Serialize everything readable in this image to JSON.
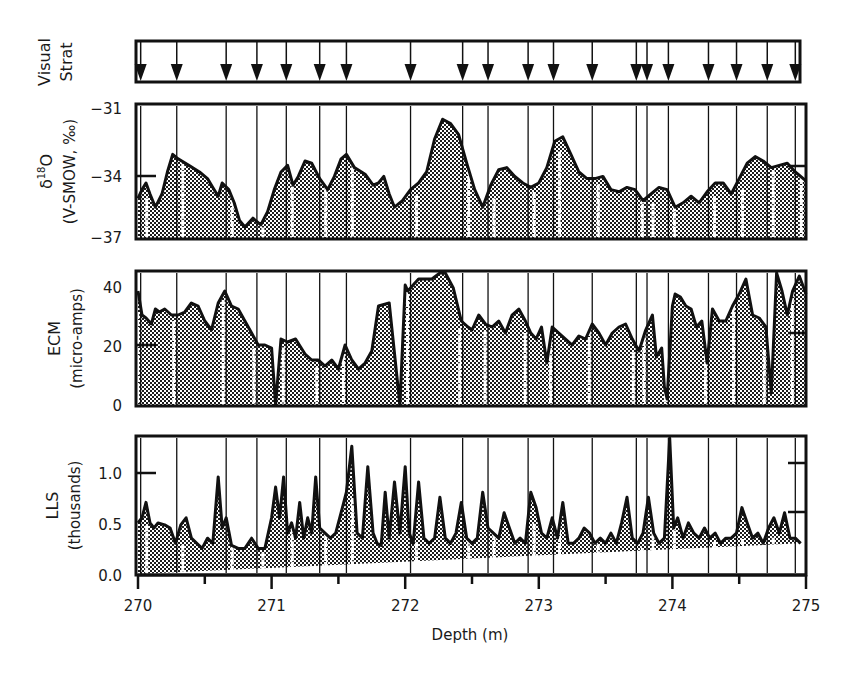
{
  "chart_data": {
    "type": "area",
    "title": "",
    "xlabel": "Depth (m)",
    "xlim": [
      270,
      275
    ],
    "x_ticks_major": [
      270,
      271,
      272,
      273,
      274,
      275
    ],
    "x_tick_labels": [
      "270",
      "271",
      "272",
      "273",
      "274",
      "275"
    ],
    "x_ticks_minor": [
      270.5,
      271.5,
      272.5,
      273.5,
      274.5
    ],
    "grid": false,
    "legend": null,
    "annual_layer_markers": {
      "label_line1": "Visual",
      "label_line2": "Strat",
      "description": "Downward arrows mark annual layers picked by visual stratigraphy; vertical lines extend through all panels.",
      "depths": [
        270.02,
        270.29,
        270.66,
        270.89,
        271.11,
        271.36,
        271.56,
        272.04,
        272.43,
        272.62,
        272.92,
        273.11,
        273.4,
        273.73,
        273.81,
        273.97,
        274.27,
        274.48,
        274.71,
        274.92
      ]
    },
    "panels": [
      {
        "id": "d18o",
        "ylabel_line1": "δ18O",
        "ylabel_sup": "18",
        "ylabel_line2": "(V-SMOW, ‰)",
        "ylim": [
          -37,
          -31
        ],
        "y_ticks": [
          -31,
          -34,
          -37
        ],
        "y_tick_labels": [
          "−31",
          "−34",
          "−37"
        ],
        "left_marker": -34,
        "right_marker": -34,
        "series": {
          "x": [
            270.0,
            270.03,
            270.06,
            270.09,
            270.13,
            270.18,
            270.22,
            270.26,
            270.3,
            270.38,
            270.46,
            270.52,
            270.56,
            270.6,
            270.63,
            270.68,
            270.72,
            270.76,
            270.8,
            270.86,
            270.92,
            270.97,
            271.02,
            271.07,
            271.12,
            271.16,
            271.2,
            271.25,
            271.3,
            271.36,
            271.42,
            271.47,
            271.52,
            271.56,
            271.62,
            271.7,
            271.76,
            271.8,
            271.84,
            271.88,
            271.92,
            271.98,
            272.04,
            272.1,
            272.16,
            272.22,
            272.28,
            272.34,
            272.4,
            272.46,
            272.52,
            272.58,
            272.64,
            272.7,
            272.76,
            272.82,
            272.88,
            272.94,
            273.0,
            273.06,
            273.12,
            273.18,
            273.24,
            273.3,
            273.36,
            273.42,
            273.48,
            273.54,
            273.6,
            273.66,
            273.72,
            273.78,
            273.84,
            273.9,
            273.96,
            274.02,
            274.08,
            274.14,
            274.2,
            274.26,
            274.32,
            274.38,
            274.44,
            274.5,
            274.56,
            274.62,
            274.68,
            274.74,
            274.8,
            274.86,
            274.92,
            275.0
          ],
          "values": [
            -35.2,
            -34.8,
            -34.5,
            -35.0,
            -35.6,
            -35.0,
            -34.0,
            -33.2,
            -33.4,
            -33.7,
            -34.0,
            -34.3,
            -34.7,
            -35.1,
            -34.5,
            -34.8,
            -35.4,
            -36.2,
            -36.5,
            -36.1,
            -36.4,
            -35.8,
            -34.8,
            -34.0,
            -33.7,
            -34.6,
            -34.2,
            -33.5,
            -33.6,
            -34.3,
            -34.8,
            -34.2,
            -33.4,
            -33.2,
            -33.8,
            -34.1,
            -34.6,
            -34.5,
            -34.2,
            -35.0,
            -35.6,
            -35.3,
            -34.8,
            -34.5,
            -34.0,
            -32.5,
            -31.6,
            -31.8,
            -32.3,
            -33.6,
            -34.8,
            -35.6,
            -34.6,
            -33.9,
            -33.8,
            -34.2,
            -34.5,
            -34.7,
            -34.5,
            -33.8,
            -32.6,
            -32.4,
            -33.2,
            -34.0,
            -34.3,
            -34.3,
            -34.2,
            -34.8,
            -34.9,
            -34.7,
            -34.8,
            -35.3,
            -35.0,
            -34.7,
            -34.8,
            -35.6,
            -35.4,
            -35.1,
            -35.4,
            -34.9,
            -34.5,
            -34.5,
            -35.0,
            -34.3,
            -33.6,
            -33.3,
            -33.5,
            -33.8,
            -33.7,
            -33.6,
            -34.0,
            -34.4
          ]
        }
      },
      {
        "id": "ecm",
        "ylabel_line1": "ECM",
        "ylabel_line2": "(micro-amps)",
        "ylim": [
          0,
          44
        ],
        "y_ticks": [
          0,
          20,
          40
        ],
        "y_tick_labels": [
          "0",
          "20",
          "40"
        ],
        "left_marker": 20,
        "right_marker": 23,
        "series": {
          "x": [
            270.0,
            270.03,
            270.06,
            270.1,
            270.13,
            270.16,
            270.2,
            270.25,
            270.3,
            270.35,
            270.4,
            270.45,
            270.5,
            270.55,
            270.6,
            270.65,
            270.7,
            270.75,
            270.8,
            270.85,
            270.9,
            270.95,
            271.0,
            271.03,
            271.07,
            271.12,
            271.18,
            271.25,
            271.3,
            271.35,
            271.4,
            271.45,
            271.5,
            271.55,
            271.6,
            271.65,
            271.7,
            271.75,
            271.8,
            271.88,
            271.96,
            272.0,
            272.02,
            272.06,
            272.1,
            272.14,
            272.2,
            272.26,
            272.3,
            272.36,
            272.42,
            272.47,
            272.5,
            272.55,
            272.6,
            272.65,
            272.7,
            272.75,
            272.8,
            272.85,
            272.9,
            272.94,
            272.98,
            273.02,
            273.06,
            273.1,
            273.15,
            273.2,
            273.25,
            273.3,
            273.35,
            273.4,
            273.45,
            273.5,
            273.55,
            273.6,
            273.65,
            273.7,
            273.75,
            273.8,
            273.85,
            273.88,
            273.92,
            273.94,
            273.96,
            274.0,
            274.02,
            274.06,
            274.1,
            274.14,
            274.18,
            274.22,
            274.26,
            274.3,
            274.35,
            274.4,
            274.45,
            274.5,
            274.55,
            274.6,
            274.65,
            274.7,
            274.74,
            274.78,
            274.82,
            274.86,
            274.9,
            274.95,
            275.0
          ],
          "values": [
            38,
            30,
            29,
            27,
            32,
            31,
            32,
            30,
            30,
            31,
            34,
            33,
            28,
            25,
            34,
            38,
            33,
            32,
            28,
            24,
            20,
            20,
            19,
            0,
            22,
            21,
            22,
            17,
            15,
            15,
            13,
            15,
            12,
            20,
            15,
            12,
            14,
            18,
            33,
            34,
            0,
            40,
            38,
            40,
            42,
            42,
            42,
            44,
            44,
            39,
            28,
            26,
            25,
            30,
            27,
            26,
            28,
            24,
            30,
            32,
            28,
            24,
            22,
            26,
            14,
            26,
            24,
            22,
            20,
            23,
            22,
            27,
            24,
            20,
            24,
            26,
            27,
            22,
            18,
            25,
            30,
            16,
            19,
            6,
            2,
            33,
            37,
            36,
            33,
            32,
            26,
            28,
            14,
            32,
            28,
            28,
            33,
            37,
            42,
            30,
            29,
            26,
            4,
            44,
            38,
            30,
            38,
            43,
            37
          ]
        }
      },
      {
        "id": "lls",
        "ylabel_line1": "LLS",
        "ylabel_line2": "(thousands)",
        "ylim": [
          0,
          1.35
        ],
        "y_ticks": [
          0.0,
          0.5,
          1.0
        ],
        "y_tick_labels": [
          "0.0",
          "0.5",
          "1.0"
        ],
        "left_marker": 1.0,
        "right_markers": [
          1.0,
          0.6
        ],
        "series": {
          "x": [
            270.0,
            270.03,
            270.06,
            270.09,
            270.12,
            270.15,
            270.2,
            270.24,
            270.28,
            270.32,
            270.36,
            270.4,
            270.44,
            270.48,
            270.52,
            270.56,
            270.6,
            270.63,
            270.66,
            270.7,
            270.75,
            270.8,
            270.85,
            270.9,
            270.95,
            271.0,
            271.03,
            271.06,
            271.09,
            271.12,
            271.15,
            271.18,
            271.21,
            271.24,
            271.27,
            271.3,
            271.33,
            271.36,
            271.4,
            271.44,
            271.48,
            271.52,
            271.56,
            271.6,
            271.64,
            271.68,
            271.72,
            271.76,
            271.79,
            271.82,
            271.85,
            271.88,
            271.92,
            271.96,
            272.0,
            272.03,
            272.06,
            272.1,
            272.14,
            272.18,
            272.22,
            272.26,
            272.3,
            272.34,
            272.38,
            272.42,
            272.46,
            272.5,
            272.54,
            272.58,
            272.62,
            272.66,
            272.7,
            272.74,
            272.78,
            272.82,
            272.86,
            272.9,
            272.94,
            272.98,
            273.02,
            273.06,
            273.1,
            273.14,
            273.18,
            273.22,
            273.26,
            273.3,
            273.34,
            273.38,
            273.42,
            273.46,
            273.5,
            273.54,
            273.58,
            273.62,
            273.66,
            273.7,
            273.74,
            273.78,
            273.82,
            273.86,
            273.9,
            273.94,
            273.98,
            274.01,
            274.04,
            274.08,
            274.12,
            274.16,
            274.2,
            274.24,
            274.28,
            274.32,
            274.36,
            274.4,
            274.44,
            274.48,
            274.52,
            274.56,
            274.6,
            274.64,
            274.68,
            274.72,
            274.76,
            274.8,
            274.84,
            274.88,
            274.92,
            274.96,
            275.0
          ],
          "values": [
            0.5,
            0.55,
            0.7,
            0.5,
            0.45,
            0.5,
            0.48,
            0.45,
            0.3,
            0.48,
            0.55,
            0.35,
            0.3,
            0.25,
            0.35,
            0.3,
            0.95,
            0.45,
            0.55,
            0.28,
            0.25,
            0.25,
            0.35,
            0.25,
            0.25,
            0.55,
            0.85,
            0.55,
            0.95,
            0.4,
            0.5,
            0.35,
            0.7,
            0.35,
            0.55,
            0.4,
            0.95,
            0.45,
            0.4,
            0.35,
            0.4,
            0.6,
            0.8,
            1.25,
            0.4,
            0.35,
            1.05,
            0.4,
            0.3,
            0.28,
            0.8,
            0.35,
            0.9,
            0.4,
            1.05,
            0.4,
            0.3,
            0.9,
            0.35,
            0.3,
            0.35,
            0.75,
            0.35,
            0.3,
            0.4,
            0.7,
            0.35,
            0.3,
            0.35,
            0.8,
            0.45,
            0.4,
            0.35,
            0.6,
            0.45,
            0.3,
            0.35,
            0.3,
            0.8,
            0.65,
            0.4,
            0.35,
            0.55,
            0.35,
            0.7,
            0.3,
            0.3,
            0.35,
            0.45,
            0.4,
            0.3,
            0.35,
            0.3,
            0.4,
            0.3,
            0.5,
            0.75,
            0.35,
            0.3,
            0.4,
            0.75,
            0.4,
            0.3,
            0.35,
            1.35,
            0.45,
            0.55,
            0.35,
            0.5,
            0.4,
            0.35,
            0.45,
            0.35,
            0.4,
            0.3,
            0.35,
            0.35,
            0.4,
            0.65,
            0.5,
            0.35,
            0.4,
            0.3,
            0.45,
            0.55,
            0.4,
            0.6,
            0.35,
            0.35,
            0.3
          ]
        }
      }
    ]
  },
  "axis": {
    "x_title": "Depth (m)"
  },
  "styles": {
    "ink": "#111111",
    "fill_pattern_dark": "#1c1c1c",
    "fill_pattern_light": "#ffffff",
    "background": "#ffffff"
  }
}
